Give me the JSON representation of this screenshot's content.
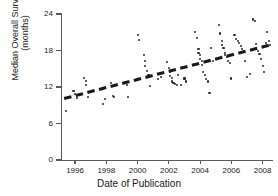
{
  "chart_data": {
    "type": "scatter",
    "title": "",
    "xlabel": "Date of Publication",
    "ylabel": "Median Overall Survival (months)",
    "ylabel_line1": "Median Overall Survival",
    "ylabel_line2": "(months)",
    "xlim": [
      1995.1,
      2008.6
    ],
    "ylim": [
      0,
      24
    ],
    "xticks": [
      1996,
      1998,
      2000,
      2002,
      2004,
      2006,
      2008
    ],
    "xtick_labels": [
      "1996",
      "1998",
      "2000",
      "2002",
      "2004",
      "2006",
      "2008"
    ],
    "yticks": [
      0,
      6,
      12,
      18,
      24
    ],
    "ytick_labels": [
      "0",
      "6",
      "12",
      "18",
      "24"
    ],
    "grid": false,
    "legend": null,
    "point_color": "#2b2b2b",
    "line_color": "#1a1a1a",
    "axis_color": "#58595b",
    "background": "#ffffff",
    "trendline": {
      "style": "dashed",
      "x_start": 1995.3,
      "y_start": 10.1,
      "x_end": 2008.6,
      "y_end": 19.0
    },
    "x": [
      1995.4,
      1995.9,
      1996.0,
      1996.1,
      1996.6,
      1996.7,
      1996.7,
      1996.8,
      1997.8,
      1997.9,
      1998.3,
      1998.4,
      1998.5,
      1999.2,
      1999.3,
      1999.4,
      2000.0,
      2000.1,
      2000.4,
      2000.5,
      2000.5,
      2000.6,
      2000.7,
      2000.8,
      2001.3,
      2001.5,
      2001.9,
      2002.0,
      2002.1,
      2002.1,
      2002.2,
      2002.2,
      2002.3,
      2002.4,
      2002.5,
      2002.6,
      2002.8,
      2003.0,
      2003.1,
      2003.7,
      2003.8,
      2003.9,
      2003.9,
      2004.0,
      2004.0,
      2004.1,
      2004.1,
      2004.2,
      2004.3,
      2004.4,
      2004.5,
      2004.6,
      2004.7,
      2004.8,
      2005.2,
      2005.3,
      2005.4,
      2005.4,
      2005.5,
      2005.6,
      2005.6,
      2005.7,
      2005.8,
      2005.9,
      2006.0,
      2006.2,
      2006.3,
      2006.4,
      2006.5,
      2006.6,
      2006.7,
      2006.8,
      2006.9,
      2007.0,
      2007.2,
      2007.4,
      2007.5,
      2007.6,
      2007.6,
      2007.7,
      2007.8,
      2007.9,
      2008.0,
      2008.1,
      2008.2,
      2008.3,
      2008.4,
      2008.5
    ],
    "y": [
      8.1,
      11.4,
      10.8,
      10.2,
      13.5,
      13.0,
      12.4,
      10.4,
      9.2,
      10.1,
      12.6,
      10.5,
      10.3,
      12.8,
      12.4,
      10.4,
      20.5,
      19.7,
      17.2,
      16.2,
      15.4,
      14.7,
      13.9,
      12.1,
      13.3,
      13.6,
      16.1,
      15.1,
      14.4,
      13.8,
      13.5,
      12.9,
      12.6,
      12.5,
      12.3,
      14.0,
      12.3,
      13.4,
      12.9,
      21.0,
      20.1,
      18.3,
      17.6,
      17.2,
      16.6,
      16.2,
      15.6,
      14.5,
      13.9,
      13.3,
      12.9,
      11.0,
      18.4,
      16.2,
      22.2,
      20.8,
      19.5,
      18.9,
      18.4,
      17.6,
      17.3,
      16.9,
      16.3,
      15.9,
      13.4,
      20.6,
      19.9,
      19.5,
      19.2,
      18.8,
      18.3,
      17.9,
      16.3,
      13.6,
      14.1,
      23.1,
      22.8,
      19.0,
      18.4,
      17.9,
      17.4,
      16.6,
      15.4,
      14.4,
      19.3,
      21.1,
      19.6,
      18.9
    ]
  }
}
